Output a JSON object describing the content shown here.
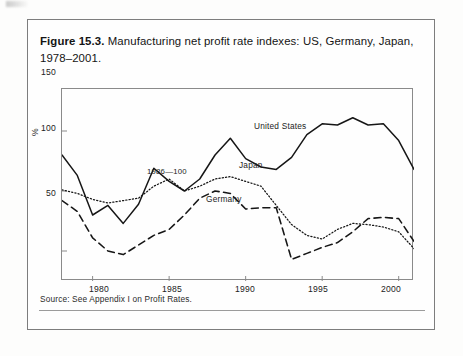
{
  "figure": {
    "number_label": "Figure 15.3.",
    "caption": " Manufacturing net profit rate indexes: US, Germany, Japan, 1978–2001.",
    "source_note": "Source: See Appendix I on Profit Rates."
  },
  "chart_data": {
    "type": "line",
    "title": "Manufacturing net profit rate indexes: US, Germany, Japan, 1978–2001",
    "xlabel": "",
    "ylabel": "%",
    "annotation": "1986—100",
    "grid": false,
    "legend_position": "inline-labels",
    "xlim": [
      1978,
      2001
    ],
    "ylim": [
      25,
      185
    ],
    "xticks": [
      1980,
      1985,
      1990,
      1995,
      2000
    ],
    "xtick_labels": [
      "1980",
      "1985",
      "1990",
      "1995",
      "2000"
    ],
    "yticks": [
      50,
      100,
      150
    ],
    "ytick_labels": [
      "50",
      "100",
      "150"
    ],
    "x": [
      1978,
      1979,
      1980,
      1981,
      1982,
      1983,
      1984,
      1985,
      1986,
      1987,
      1988,
      1989,
      1990,
      1991,
      1992,
      1993,
      1994,
      1995,
      1996,
      1997,
      1998,
      1999,
      2000,
      2001
    ],
    "series": [
      {
        "name": "United States",
        "style": "solid",
        "label": "United States",
        "values": [
          130,
          113,
          80,
          88,
          73,
          89,
          119,
          108,
          100,
          110,
          130,
          144,
          127,
          120,
          118,
          128,
          147,
          156,
          155,
          161,
          155,
          156,
          142,
          118
        ]
      },
      {
        "name": "Japan",
        "style": "dotted",
        "label": "Japan",
        "values": [
          101,
          98,
          93,
          90,
          92,
          94,
          104,
          110,
          100,
          104,
          110,
          112,
          108,
          104,
          88,
          72,
          63,
          60,
          68,
          73,
          72,
          70,
          66,
          52
        ]
      },
      {
        "name": "Germany",
        "style": "dashed",
        "label": "Germany",
        "values": [
          92,
          83,
          61,
          50,
          47,
          55,
          63,
          68,
          80,
          94,
          100,
          98,
          85,
          86,
          86,
          43,
          48,
          53,
          57,
          66,
          77,
          78,
          77,
          58
        ]
      }
    ]
  },
  "labels": {
    "united_states": "United States",
    "japan": "Japan",
    "germany": "Germany",
    "index_base": "1986—100",
    "percent": "%"
  }
}
